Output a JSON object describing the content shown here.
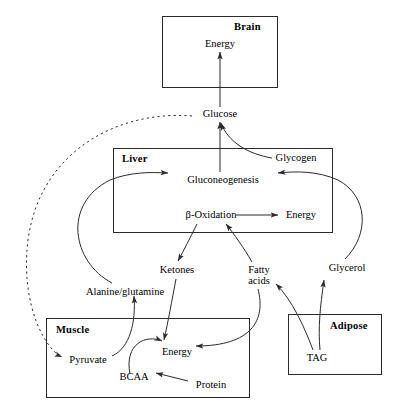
{
  "diagram": {
    "type": "flow-diagram",
    "background_color": "#ffffff",
    "line_color": "#2b2b2b",
    "text_color": "#000000"
  },
  "organs": [
    {
      "id": "brain",
      "label": "Brain",
      "label_align": "right"
    },
    {
      "id": "liver",
      "label": "Liver",
      "label_align": "left"
    },
    {
      "id": "muscle",
      "label": "Muscle",
      "label_align": "left"
    },
    {
      "id": "adipose",
      "label": "Adipose",
      "label_align": "right"
    }
  ],
  "nodes": {
    "brain_energy": "Energy",
    "glucose": "Glucose",
    "glycogen": "Glycogen",
    "gluconeogenesis": "Gluconeogenesis",
    "beta_oxidation": "β-Oxidation",
    "liver_energy": "Energy",
    "ketones": "Ketones",
    "fatty_acids_line1": "Fatty",
    "fatty_acids_line2": "acids",
    "glycerol": "Glycerol",
    "alanine_glutamine": "Alanine/glutamine",
    "pyruvate": "Pyruvate",
    "muscle_energy": "Energy",
    "bcaa": "BCAA",
    "protein": "Protein",
    "tag": "TAG"
  },
  "edges": [
    {
      "from": "glucose",
      "to": "brain_energy",
      "style": "solid"
    },
    {
      "from": "gluconeogenesis",
      "to": "glucose",
      "style": "solid"
    },
    {
      "from": "glycogen",
      "to": "glucose",
      "style": "solid"
    },
    {
      "from": "glucose",
      "to": "pyruvate",
      "style": "dotted"
    },
    {
      "from": "alanine_glutamine",
      "to": "gluconeogenesis",
      "style": "solid"
    },
    {
      "from": "glycerol",
      "to": "gluconeogenesis",
      "style": "solid"
    },
    {
      "from": "beta_oxidation",
      "to": "liver_energy",
      "style": "solid"
    },
    {
      "from": "fatty_acids",
      "to": "beta_oxidation",
      "style": "solid"
    },
    {
      "from": "beta_oxidation",
      "to": "ketones",
      "style": "solid"
    },
    {
      "from": "ketones",
      "to": "muscle_energy",
      "style": "solid"
    },
    {
      "from": "fatty_acids",
      "to": "muscle_energy",
      "style": "solid"
    },
    {
      "from": "pyruvate",
      "to": "alanine_glutamine",
      "style": "solid"
    },
    {
      "from": "bcaa",
      "to": "muscle_energy",
      "style": "solid"
    },
    {
      "from": "protein",
      "to": "bcaa",
      "style": "solid"
    },
    {
      "from": "tag",
      "to": "glycerol",
      "style": "solid"
    },
    {
      "from": "tag",
      "to": "fatty_acids",
      "style": "solid"
    }
  ]
}
